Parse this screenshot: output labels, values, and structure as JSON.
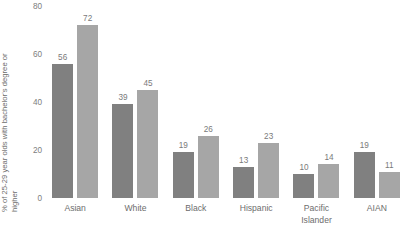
{
  "chart_data": {
    "type": "bar",
    "title": "",
    "subtitle": "",
    "xlabel": "",
    "ylabel": "% of 25-29 year olds with bachelor's degree or higher",
    "ylabel_lines": [
      "% of 25-29 year olds with bachelor's degree or",
      "higher"
    ],
    "ylim": [
      0,
      80
    ],
    "yticks": [
      80,
      60,
      40,
      20,
      0
    ],
    "ytick_labels": [
      "80",
      "60",
      "40",
      "20",
      "0"
    ],
    "grid": false,
    "legend": false,
    "legend_position": "none",
    "categories": [
      "Asian",
      "White",
      "Black",
      "Hispanic",
      "Pacific Islander",
      "AIAN"
    ],
    "category_label_lines": [
      [
        "Asian"
      ],
      [
        "White"
      ],
      [
        "Black"
      ],
      [
        "Hispanic"
      ],
      [
        "Pacific",
        "Islander"
      ],
      [
        "AIAN"
      ]
    ],
    "series": [
      {
        "name": "series-1",
        "color": "#808080",
        "values": [
          56,
          39,
          19,
          13,
          10,
          19
        ]
      },
      {
        "name": "series-2",
        "color": "#a6a6a6",
        "values": [
          72,
          45,
          26,
          23,
          14,
          11
        ]
      }
    ],
    "data_labels": [
      [
        "56",
        "72"
      ],
      [
        "39",
        "45"
      ],
      [
        "19",
        "26"
      ],
      [
        "13",
        "23"
      ],
      [
        "10",
        "14"
      ],
      [
        "19",
        "11"
      ]
    ],
    "colors": {
      "series_1": "#808080",
      "series_2": "#a6a6a6",
      "text": "#6d6d6d",
      "tick_text": "#7d7d7d",
      "data_label_text": "#7a7a7a",
      "background": "#ffffff"
    }
  }
}
